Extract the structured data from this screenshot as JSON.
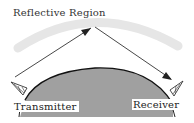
{
  "diagram": {
    "title": "Reflective Region",
    "transmitter_label": "Transmitter",
    "receiver_label": "Receiver",
    "elements": {
      "reflective_region": "light gray arc band (ionosphere)",
      "earth": "gray dome with black outline",
      "path": "incident ray from transmitter to reflective region apex, reflected ray down to receiver",
      "transmitter_icon": "antenna-icon",
      "receiver_icon": "antenna-icon"
    },
    "colors": {
      "background": "#ffffff",
      "reflective_band": "#e6e6e6",
      "earth_fill": "#a0a0a0",
      "earth_outline": "#111111",
      "ray": "#333333",
      "text": "#222222"
    }
  }
}
